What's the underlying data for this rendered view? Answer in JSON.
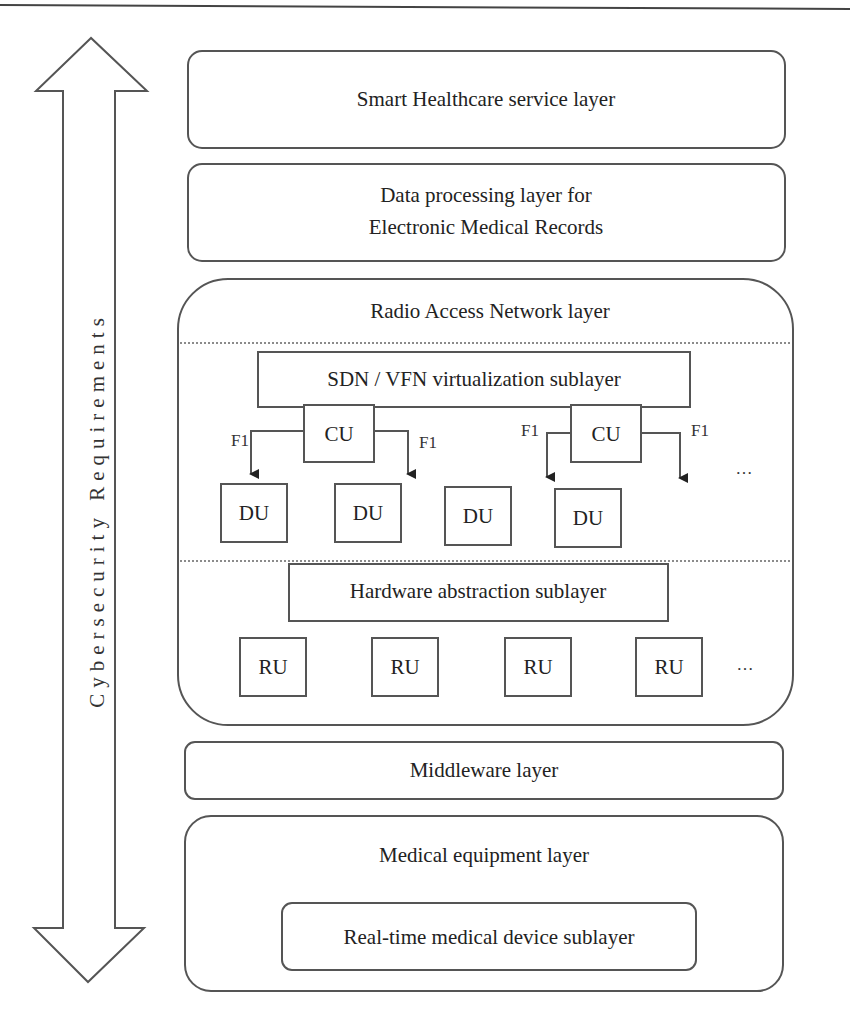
{
  "side_arrow": {
    "label": "Cybersecurity Requirements",
    "direction": "bidirectional-vertical"
  },
  "layers": {
    "service": {
      "label": "Smart Healthcare service layer"
    },
    "data_processing": {
      "line1": "Data processing layer for",
      "line2": "Electronic Medical Records"
    },
    "ran": {
      "label": "Radio Access Network layer",
      "virtualization": {
        "label": "SDN / VFN virtualization sublayer"
      },
      "cu_groups": [
        {
          "cu": "CU",
          "left_link": "F1",
          "right_link": "F1",
          "dus": [
            "DU",
            "DU"
          ]
        },
        {
          "cu": "CU",
          "left_link": "F1",
          "right_link": "F1",
          "dus": [
            "DU",
            "DU"
          ]
        }
      ],
      "du_ellipsis": "…",
      "hardware": {
        "label": "Hardware abstraction sublayer"
      },
      "rus": [
        "RU",
        "RU",
        "RU",
        "RU"
      ],
      "ru_ellipsis": "…"
    },
    "middleware": {
      "label": "Middleware layer"
    },
    "medical_equipment": {
      "label": "Medical equipment layer",
      "sublayer": {
        "label": "Real-time medical device sublayer"
      }
    }
  }
}
